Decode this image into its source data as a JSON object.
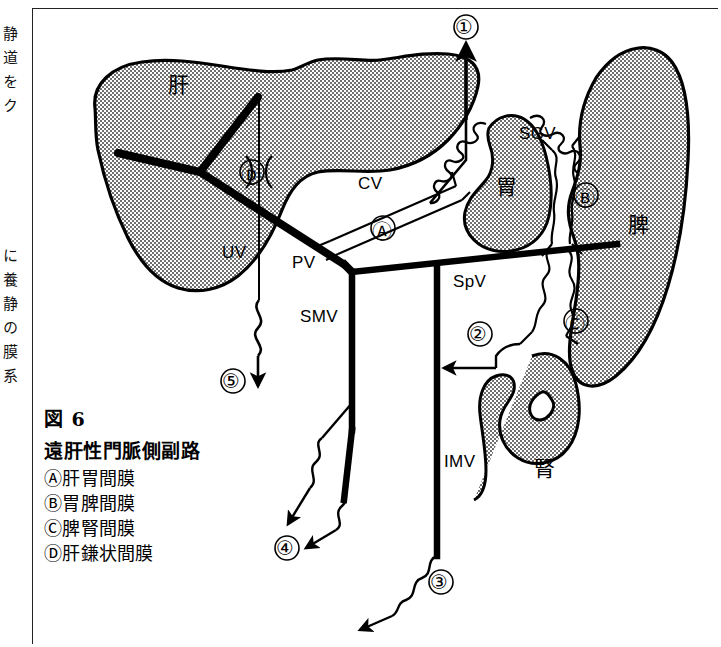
{
  "page": {
    "margin_text_upper": "静道をク",
    "margin_text_lower": "に養静の膜系"
  },
  "caption": {
    "figure_number": "図 6",
    "title": "遠肝性門脈側副路",
    "items": [
      "Ⓐ肝胃間膜",
      "Ⓑ胃脾間膜",
      "Ⓒ脾腎間膜",
      "Ⓓ肝鎌状間膜"
    ]
  },
  "diagram": {
    "organs": [
      {
        "id": "liver",
        "label": "肝"
      },
      {
        "id": "stomach",
        "label": "胃"
      },
      {
        "id": "spleen",
        "label": "脾"
      },
      {
        "id": "kidney",
        "label": "腎"
      }
    ],
    "vessels": [
      {
        "id": "pv",
        "label": "PV"
      },
      {
        "id": "uv",
        "label": "UV"
      },
      {
        "id": "cv",
        "label": "CV"
      },
      {
        "id": "sgv",
        "label": "SGV"
      },
      {
        "id": "spv",
        "label": "SpV"
      },
      {
        "id": "smv",
        "label": "SMV"
      },
      {
        "id": "imv",
        "label": "IMV"
      }
    ],
    "ligament_markers": [
      {
        "id": "a",
        "label": "Ⓐ"
      },
      {
        "id": "b",
        "label": "Ⓑ"
      },
      {
        "id": "c",
        "label": "Ⓒ"
      },
      {
        "id": "d",
        "label": "Ⓓ"
      }
    ],
    "shunt_markers": [
      {
        "id": "1",
        "label": "①"
      },
      {
        "id": "2",
        "label": "②"
      },
      {
        "id": "3",
        "label": "③"
      },
      {
        "id": "4",
        "label": "④"
      },
      {
        "id": "5",
        "label": "⑤"
      }
    ]
  },
  "colors": {
    "ink": "#000000",
    "organ_fill": "#b9b9b9",
    "frame": "#222222",
    "background": "#ffffff"
  }
}
